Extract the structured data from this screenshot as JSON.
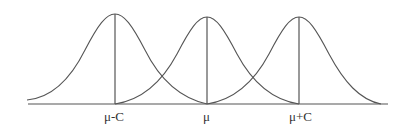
{
  "diagram": {
    "type": "overlapping-normal-distributions",
    "curves": [
      {
        "name": "left",
        "center_label": "μ-C"
      },
      {
        "name": "middle",
        "center_label": "μ"
      },
      {
        "name": "right",
        "center_label": "μ+C"
      }
    ],
    "labels": {
      "left": "μ-C",
      "middle": "μ",
      "right": "μ+C"
    },
    "stroke_color": "#555555",
    "background": "#ffffff"
  }
}
